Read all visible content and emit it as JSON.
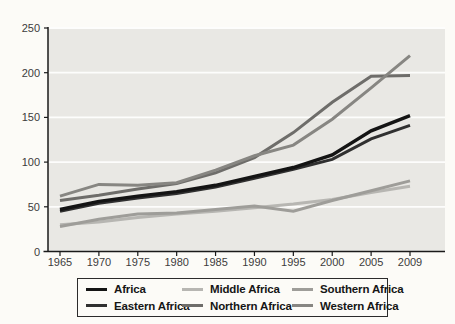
{
  "chart_data": {
    "type": "line",
    "title": "",
    "xlabel": "",
    "ylabel": "",
    "x_labels": [
      "1965",
      "1970",
      "1975",
      "1980",
      "1985",
      "1990",
      "1995",
      "2000",
      "2005",
      "2009"
    ],
    "series": [
      {
        "name": "Africa",
        "color": "#141414",
        "stroke_width": 3.4,
        "values": [
          47,
          56,
          62,
          67,
          74,
          84,
          94,
          108,
          135,
          152
        ]
      },
      {
        "name": "Eastern Africa",
        "color": "#303030",
        "stroke_width": 3.0,
        "values": [
          45,
          54,
          60,
          65,
          72,
          82,
          92,
          103,
          126,
          141
        ]
      },
      {
        "name": "Middle Africa",
        "color": "#b7b6b2",
        "stroke_width": 3.0,
        "values": [
          30,
          33,
          38,
          42,
          45,
          49,
          53,
          58,
          66,
          73
        ]
      },
      {
        "name": "Northern Africa",
        "color": "#6e6d6a",
        "stroke_width": 3.0,
        "values": [
          57,
          63,
          70,
          76,
          88,
          105,
          133,
          167,
          196,
          197
        ]
      },
      {
        "name": "Southern Africa",
        "color": "#9e9d99",
        "stroke_width": 3.0,
        "values": [
          28,
          36,
          42,
          43,
          47,
          51,
          45,
          57,
          68,
          79
        ]
      },
      {
        "name": "Western Africa",
        "color": "#878682",
        "stroke_width": 3.0,
        "values": [
          62,
          75,
          74,
          77,
          91,
          107,
          119,
          148,
          183,
          219
        ]
      }
    ],
    "draw_order": [
      "Middle Africa",
      "Southern Africa",
      "Northern Africa",
      "Western Africa",
      "Eastern Africa",
      "Africa"
    ],
    "y_ticks": [
      0,
      50,
      100,
      150,
      200,
      250
    ],
    "ylim": [
      0,
      250
    ],
    "grid": "horizontal-white-on-gray",
    "legend_position": "bottom",
    "colors": {
      "page_bg": "#fcfbf7",
      "plot_bg": "#e9e8e4",
      "gridline": "#fdfdfc",
      "axis": "#1a1a1a",
      "tick_label": "#3c3c3c"
    }
  }
}
